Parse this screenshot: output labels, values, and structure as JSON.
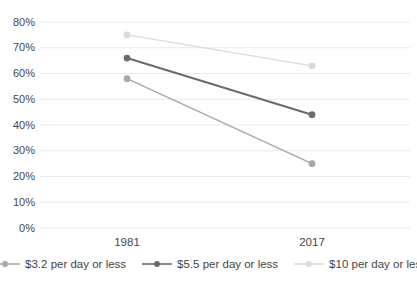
{
  "chart_data": {
    "type": "line",
    "title": "",
    "xlabel": "",
    "ylabel": "",
    "categories": [
      "1981",
      "2017"
    ],
    "series": [
      {
        "name": "$3.2 per day or less",
        "values": [
          58,
          25
        ],
        "color": "#a9a9a9"
      },
      {
        "name": "$5.5 per day or less",
        "values": [
          66,
          44
        ],
        "color": "#6b6b6b"
      },
      {
        "name": "$10 per day or less",
        "values": [
          75,
          63
        ],
        "color": "#dcdad1"
      }
    ],
    "ylim": [
      0,
      80
    ],
    "ytick_step": 10,
    "yticks": [
      "0%",
      "10%",
      "20%",
      "30%",
      "40%",
      "50%",
      "60%",
      "70%",
      "80%"
    ],
    "grid": "horizontal",
    "gridline_color": "#eaeaea",
    "text_color": "#474747",
    "legend_position": "bottom"
  }
}
